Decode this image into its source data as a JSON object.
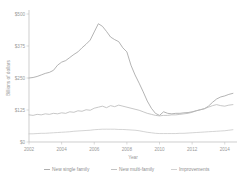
{
  "chart_data": {
    "type": "line",
    "title": "",
    "xlabel": "Year",
    "ylabel": "Billions of dollars",
    "xlim": [
      2002,
      2014.75
    ],
    "ylim": [
      0,
      500
    ],
    "grid": false,
    "legend_position": "bottom",
    "y_ticks": [
      0,
      125,
      250,
      375,
      500
    ],
    "y_tick_labels": [
      "$0",
      "$125",
      "$250",
      "$375",
      "$500"
    ],
    "x_ticks": [
      2002,
      2004,
      2006,
      2008,
      2010,
      2012,
      2014
    ],
    "x_tick_labels": [
      "2002",
      "2004",
      "2006",
      "2008",
      "2010",
      "2012",
      "2014"
    ],
    "x": [
      2002.0,
      2002.25,
      2002.5,
      2002.75,
      2003.0,
      2003.25,
      2003.5,
      2003.75,
      2004.0,
      2004.25,
      2004.5,
      2004.75,
      2005.0,
      2005.25,
      2005.5,
      2005.75,
      2006.0,
      2006.25,
      2006.5,
      2006.75,
      2007.0,
      2007.25,
      2007.5,
      2007.75,
      2008.0,
      2008.25,
      2008.5,
      2008.75,
      2009.0,
      2009.25,
      2009.5,
      2009.75,
      2010.0,
      2010.25,
      2010.5,
      2010.75,
      2011.0,
      2011.25,
      2011.5,
      2011.75,
      2012.0,
      2012.25,
      2012.5,
      2012.75,
      2013.0,
      2013.25,
      2013.5,
      2013.75,
      2014.0,
      2014.25,
      2014.5
    ],
    "series": [
      {
        "name": "New single family",
        "color": "#9b9b9b",
        "values": [
          250,
          252,
          256,
          262,
          268,
          272,
          280,
          300,
          312,
          318,
          330,
          342,
          352,
          368,
          382,
          398,
          430,
          462,
          452,
          432,
          410,
          400,
          392,
          368,
          352,
          300,
          262,
          230,
          196,
          160,
          132,
          112,
          104,
          118,
          112,
          110,
          112,
          112,
          114,
          115,
          118,
          122,
          126,
          130,
          140,
          155,
          168,
          176,
          180,
          186,
          190
        ]
      },
      {
        "name": "New multi-family",
        "color": "#b4b4b4",
        "values": [
          106,
          104,
          108,
          106,
          110,
          108,
          112,
          110,
          114,
          112,
          118,
          116,
          122,
          120,
          126,
          124,
          132,
          136,
          140,
          134,
          142,
          138,
          144,
          140,
          136,
          132,
          128,
          124,
          118,
          112,
          108,
          104,
          102,
          104,
          104,
          106,
          106,
          108,
          110,
          112,
          116,
          122,
          126,
          130,
          136,
          142,
          146,
          142,
          140,
          144,
          146
        ]
      },
      {
        "name": "Improvements",
        "color": "#c6c6c6",
        "values": [
          32,
          32,
          33,
          34,
          34,
          35,
          36,
          37,
          38,
          39,
          40,
          42,
          43,
          44,
          45,
          46,
          48,
          49,
          50,
          50,
          50,
          50,
          49,
          49,
          48,
          47,
          46,
          44,
          41,
          38,
          36,
          34,
          33,
          33,
          33,
          33,
          33,
          34,
          34,
          35,
          36,
          37,
          38,
          39,
          40,
          41,
          42,
          43,
          44,
          46,
          48
        ]
      }
    ]
  },
  "legend": {
    "items": [
      {
        "label": "New single family"
      },
      {
        "label": "New multi-family"
      },
      {
        "label": "Improvements"
      }
    ]
  }
}
